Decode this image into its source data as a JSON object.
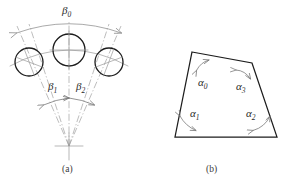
{
  "figure": {
    "background_color": "#ffffff",
    "line_color": "#1c1c1c",
    "construction_color": "#9a9a9a",
    "annotation_color": "#7a7a7a",
    "panels": [
      {
        "id": "panel-a",
        "caption": "(a)",
        "description": "three circles on an arc converging to an apex",
        "labels": [
          {
            "name": "beta-0",
            "symbol": "β",
            "subscript": "0"
          },
          {
            "name": "beta-1",
            "symbol": "β",
            "subscript": "1"
          },
          {
            "name": "beta-2",
            "symbol": "β",
            "subscript": "2"
          }
        ]
      },
      {
        "id": "panel-b",
        "caption": "(b)",
        "description": "quadrilateral with four interior angles marked",
        "labels": [
          {
            "name": "alpha-0",
            "symbol": "α",
            "subscript": "0"
          },
          {
            "name": "alpha-1",
            "symbol": "α",
            "subscript": "1"
          },
          {
            "name": "alpha-2",
            "symbol": "α",
            "subscript": "2"
          },
          {
            "name": "alpha-3",
            "symbol": "α",
            "subscript": "3"
          }
        ]
      }
    ],
    "captions": {
      "panel_a": "(a)",
      "panel_b": "(b)"
    },
    "symbols": {
      "beta_0": "β",
      "beta_0_sub": "0",
      "beta_1": "β",
      "beta_1_sub": "1",
      "beta_2": "β",
      "beta_2_sub": "2",
      "alpha_0": "α",
      "alpha_0_sub": "0",
      "alpha_1": "α",
      "alpha_1_sub": "1",
      "alpha_2": "α",
      "alpha_2_sub": "2",
      "alpha_3": "α",
      "alpha_3_sub": "3"
    }
  }
}
